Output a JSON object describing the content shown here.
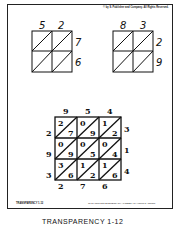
{
  "header": {
    "copyright": "© by S. Publisher and Company. All Rights Reserved."
  },
  "grid_a": {
    "top": [
      "5",
      "2"
    ],
    "side": [
      "7",
      "6"
    ]
  },
  "grid_b": {
    "top": [
      "8",
      "3"
    ],
    "side": [
      "2",
      "9"
    ]
  },
  "lattice": {
    "top": [
      "9",
      "5",
      "4"
    ],
    "right": [
      "3",
      "1",
      "4"
    ],
    "left": [
      "2",
      "9",
      "3"
    ],
    "bottom": [
      "2",
      "7",
      "6"
    ],
    "cells": [
      [
        [
          "2",
          "7"
        ],
        [
          "0",
          "9"
        ],
        [
          "1",
          "2"
        ]
      ],
      [
        [
          "0",
          "9"
        ],
        [
          "0",
          "5"
        ],
        [
          "0",
          "4"
        ]
      ],
      [
        [
          "3",
          "6"
        ],
        [
          "1",
          "2"
        ],
        [
          "1",
          "6"
        ]
      ]
    ]
  },
  "footer": {
    "left": "TRANSPARENCY 1-12",
    "right": "To be used with ELEMENTARY ALGEBRA by Harold R. Jacobs"
  },
  "caption": "TRANSPARENCY 1-12"
}
